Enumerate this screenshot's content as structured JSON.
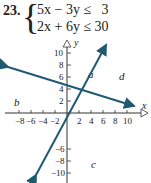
{
  "problem": {
    "number": "23.",
    "inequalities": [
      "5x − 3y ≤   3",
      "2x + 6y ≤ 30"
    ]
  },
  "graph": {
    "axis_labels": {
      "x": "x",
      "y": "y"
    },
    "x_ticks": [
      "−8",
      "−6",
      "−4",
      "−2",
      "2",
      "4",
      "6",
      "8",
      "10"
    ],
    "y_ticks": [
      "10",
      "8",
      "6",
      "4",
      "2",
      "−6",
      "−8",
      "−10"
    ],
    "region_labels": [
      "a",
      "b",
      "c",
      "d"
    ],
    "line_color": "#1f5a73"
  }
}
